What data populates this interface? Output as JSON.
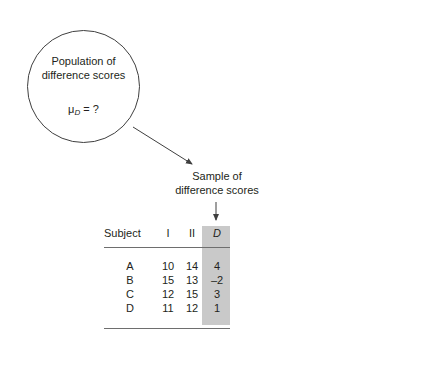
{
  "figure": {
    "population": {
      "label_line1": "Population of",
      "label_line2": "difference scores",
      "mu_symbol": "μ",
      "mu_subscript": "D",
      "mu_value": " = ?"
    },
    "sample_caption": {
      "line1": "Sample of",
      "line2": "difference scores"
    },
    "arrows": [
      {
        "name": "population-to-sample-arrow",
        "from": [
          133,
          127
        ],
        "to": [
          195,
          166
        ]
      },
      {
        "name": "caption-to-column-arrow",
        "from": [
          216,
          202
        ],
        "to": [
          216,
          222
        ]
      }
    ],
    "colors": {
      "ink": "#231f20",
      "rule": "#6e6e6e",
      "shade": "#c9c9c9",
      "background": "#ffffff"
    }
  },
  "table": {
    "headers": [
      "Subject",
      "I",
      "II",
      "D"
    ],
    "highlighted_column": "D",
    "rows": [
      {
        "subject": "A",
        "i": "10",
        "ii": "14",
        "d": "4"
      },
      {
        "subject": "B",
        "i": "15",
        "ii": "13",
        "d": "–2"
      },
      {
        "subject": "C",
        "i": "12",
        "ii": "15",
        "d": "3"
      },
      {
        "subject": "D",
        "i": "11",
        "ii": "12",
        "d": "1"
      }
    ]
  }
}
